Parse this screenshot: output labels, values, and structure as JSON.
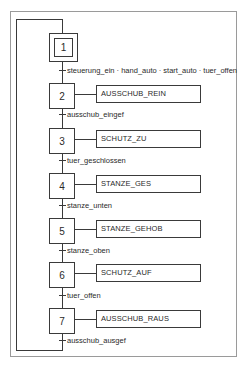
{
  "diagram": {
    "type": "grafcet-sfc",
    "initial_step": {
      "number": "1"
    },
    "steps": [
      {
        "number": "2",
        "action": "AUSSCHUB_REIN"
      },
      {
        "number": "3",
        "action": "SCHUTZ_ZU"
      },
      {
        "number": "4",
        "action": "STANZE_GES"
      },
      {
        "number": "5",
        "action": "STANZE_GEHOB"
      },
      {
        "number": "6",
        "action": "SCHUTZ_AUF"
      },
      {
        "number": "7",
        "action": "AUSSCHUB_RAUS"
      }
    ],
    "transitions": [
      {
        "from": "1",
        "to": "2",
        "condition": "steuerung_ein · hand_auto · start_auto · tuer_offen"
      },
      {
        "from": "2",
        "to": "3",
        "condition": "ausschub_eingef"
      },
      {
        "from": "3",
        "to": "4",
        "condition": "tuer_geschlossen"
      },
      {
        "from": "4",
        "to": "5",
        "condition": "stanze_unten"
      },
      {
        "from": "5",
        "to": "6",
        "condition": "stanze_oben"
      },
      {
        "from": "6",
        "to": "7",
        "condition": "tuer_offen"
      },
      {
        "from": "7",
        "to": "1",
        "condition": "ausschub_ausgef"
      }
    ],
    "colors": {
      "line": "#3a3a3a",
      "frame": "#9a9a9a",
      "background": "#ffffff"
    }
  }
}
